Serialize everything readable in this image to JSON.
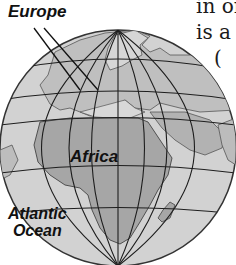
{
  "figure": {
    "type": "globe-map",
    "colors": {
      "ocean": "#d2d2d2",
      "land": "#a9a9a9",
      "land_light": "#c4c4c4",
      "gridlines": "#1e1e1e",
      "outline": "#333333",
      "background": "#ffffff"
    },
    "labels": {
      "europe": "Europe",
      "africa": "Africa",
      "atlantic_line1": "Atlantic",
      "atlantic_line2": "Ocean"
    }
  },
  "background_text": {
    "line1": "in or",
    "line2": "is a",
    "line3": "("
  }
}
